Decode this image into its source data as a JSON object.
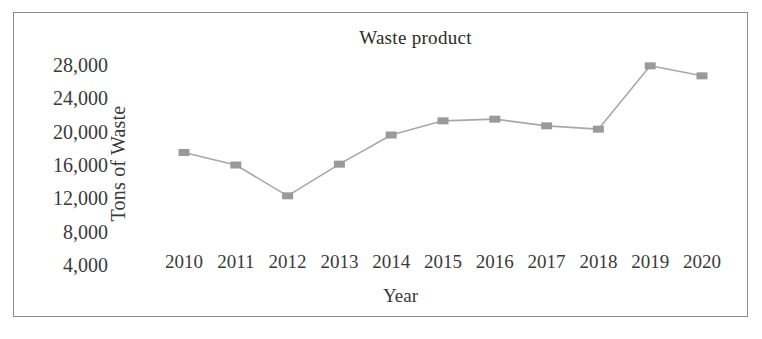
{
  "figure": {
    "border_color": "#8a8a8a",
    "background": "#ffffff"
  },
  "chart_data": {
    "type": "line",
    "title": "Waste product",
    "xlabel": "Year",
    "ylabel": "Tons of Waste",
    "grid": false,
    "legend": "none",
    "categories": [
      "2010",
      "2011",
      "2012",
      "2013",
      "2014",
      "2015",
      "2016",
      "2017",
      "2018",
      "2019",
      "2020"
    ],
    "values": [
      17500,
      16000,
      12300,
      16100,
      19600,
      21300,
      21500,
      20700,
      20300,
      27900,
      26700
    ],
    "ylim": [
      0,
      30000
    ],
    "ytick_labels": [
      "28,000",
      "24,000",
      "20,000",
      "16,000",
      "12,000",
      "8,000",
      "4,000"
    ],
    "ytick_values": [
      28000,
      24000,
      20000,
      16000,
      12000,
      8000,
      4000
    ],
    "series": [
      {
        "name": "Waste product",
        "values": [
          17500,
          16000,
          12300,
          16100,
          19600,
          21300,
          21500,
          20700,
          20300,
          27900,
          26700
        ],
        "line_color": "#a8a8a8",
        "marker_color": "#9a9a9a",
        "marker": "square"
      }
    ]
  }
}
